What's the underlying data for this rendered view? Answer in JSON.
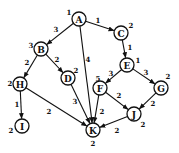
{
  "diagram": {
    "type": "directed-weighted-graph",
    "node_radius": 7,
    "nodes": [
      {
        "id": "A",
        "label": "A",
        "value": "1",
        "x": 79,
        "y": 19,
        "vx": 69,
        "vy": 12
      },
      {
        "id": "B",
        "label": "B",
        "value": "3",
        "x": 41,
        "y": 49,
        "vx": 31,
        "vy": 45
      },
      {
        "id": "C",
        "label": "C",
        "value": "2",
        "x": 121,
        "y": 33,
        "vx": 131,
        "vy": 25
      },
      {
        "id": "D",
        "label": "D",
        "value": "2",
        "x": 68,
        "y": 78,
        "vx": 76,
        "vy": 70
      },
      {
        "id": "E",
        "label": "E",
        "value": "1",
        "x": 127,
        "y": 65,
        "vx": 138,
        "vy": 60
      },
      {
        "id": "F",
        "label": "F",
        "value": "5",
        "x": 100,
        "y": 88,
        "vx": 98,
        "vy": 78
      },
      {
        "id": "G",
        "label": "G",
        "value": "2",
        "x": 161,
        "y": 88,
        "vx": 168,
        "vy": 76
      },
      {
        "id": "H",
        "label": "H",
        "value": "2",
        "x": 20,
        "y": 84,
        "vx": 10,
        "vy": 83
      },
      {
        "id": "I",
        "label": "I",
        "value": "2",
        "x": 22,
        "y": 126,
        "vx": 11,
        "vy": 130
      },
      {
        "id": "J",
        "label": "J",
        "value": "2",
        "x": 134,
        "y": 114,
        "vx": 143,
        "vy": 124
      },
      {
        "id": "K",
        "label": "K",
        "value": "2",
        "x": 93,
        "y": 130,
        "vx": 93,
        "vy": 143
      }
    ],
    "edges": [
      {
        "from": "A",
        "to": "B",
        "weight": "3",
        "wx": 56,
        "wy": 29
      },
      {
        "from": "A",
        "to": "C",
        "weight": "1",
        "wx": 98,
        "wy": 20
      },
      {
        "from": "A",
        "to": "K",
        "weight": "4",
        "wx": 88,
        "wy": 59
      },
      {
        "from": "B",
        "to": "H",
        "weight": "2",
        "wx": 27,
        "wy": 62
      },
      {
        "from": "B",
        "to": "D",
        "weight": "2",
        "wx": 57,
        "wy": 59
      },
      {
        "from": "C",
        "to": "E",
        "weight": "1",
        "wx": 130,
        "wy": 47
      },
      {
        "from": "E",
        "to": "F",
        "weight": "3",
        "wx": 111,
        "wy": 73
      },
      {
        "from": "E",
        "to": "G",
        "weight": "3",
        "wx": 146,
        "wy": 72
      },
      {
        "from": "H",
        "to": "I",
        "weight": "1",
        "wx": 17,
        "wy": 104
      },
      {
        "from": "H",
        "to": "K",
        "weight": "2",
        "wx": 49,
        "wy": 111
      },
      {
        "from": "D",
        "to": "K",
        "weight": "3",
        "wx": 75,
        "wy": 101
      },
      {
        "from": "F",
        "to": "J",
        "weight": "2",
        "wx": 119,
        "wy": 95
      },
      {
        "from": "F",
        "to": "K",
        "weight": "2",
        "wx": 102,
        "wy": 111
      },
      {
        "from": "G",
        "to": "J",
        "weight": "2",
        "wx": 153,
        "wy": 103
      },
      {
        "from": "J",
        "to": "K",
        "weight": "2",
        "wx": 117,
        "wy": 130
      }
    ]
  }
}
